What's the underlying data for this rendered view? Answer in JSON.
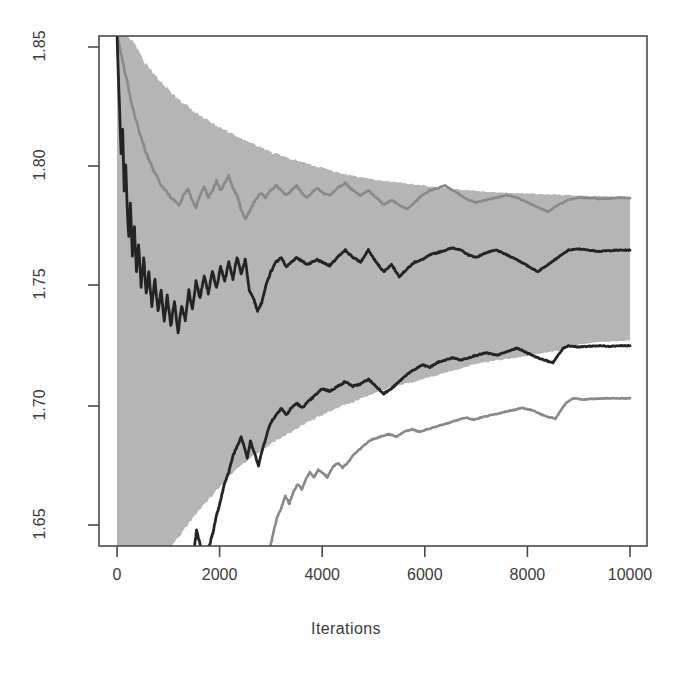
{
  "chart_data": {
    "type": "line",
    "title": "",
    "subtitle": "",
    "xlabel": "Iterations",
    "ylabel": "",
    "xlim": [
      0,
      10000
    ],
    "ylim": [
      1.6357,
      1.8553
    ],
    "xticks": [
      0,
      2000,
      4000,
      6000,
      8000,
      10000
    ],
    "xtick_labels": [
      "0",
      "2000",
      "4000",
      "6000",
      "8000",
      "10000"
    ],
    "yticks": [
      1.65,
      1.7,
      1.75,
      1.8,
      1.85
    ],
    "ytick_labels": [
      "1.65",
      "1.70",
      "1.75",
      "1.80",
      "1.85"
    ],
    "grid": false,
    "legend": "none",
    "colors": {
      "band_fill": "#b5b5b5",
      "dark_trace": "#242424",
      "gray_trace": "#898989",
      "frame": "#4a4a4a",
      "text": "#3b3b3b",
      "background": "#ffffff"
    },
    "series": [
      {
        "name": "band_upper",
        "role": "credible-band-upper-bound",
        "color": "#b5b5b5",
        "x": [
          0,
          60,
          120,
          180,
          240,
          300,
          360,
          420,
          480,
          540,
          600,
          700,
          800,
          900,
          1000,
          1100,
          1200,
          1300,
          1400,
          1500,
          1600,
          1700,
          1800,
          1900,
          2000,
          2200,
          2400,
          2600,
          2800,
          3000,
          3200,
          3400,
          3600,
          3800,
          4000,
          4300,
          4600,
          5000,
          5400,
          5800,
          6200,
          6600,
          7000,
          7400,
          7800,
          8200,
          8600,
          9000,
          9400,
          10000
        ],
        "y": [
          1.8553,
          1.8553,
          1.8553,
          1.8553,
          1.854,
          1.852,
          1.8505,
          1.848,
          1.8455,
          1.843,
          1.842,
          1.839,
          1.8365,
          1.834,
          1.8325,
          1.83,
          1.828,
          1.8265,
          1.825,
          1.823,
          1.8215,
          1.82,
          1.819,
          1.8175,
          1.8165,
          1.814,
          1.812,
          1.81,
          1.808,
          1.806,
          1.8045,
          1.803,
          1.802,
          1.8005,
          1.7995,
          1.7975,
          1.796,
          1.7945,
          1.7935,
          1.7925,
          1.7915,
          1.7905,
          1.7898,
          1.7892,
          1.7888,
          1.7885,
          1.7882,
          1.7878,
          1.7876,
          1.7872
        ]
      },
      {
        "name": "band_lower",
        "role": "credible-band-lower-bound",
        "color": "#b5b5b5",
        "x": [
          0,
          200,
          400,
          600,
          800,
          900,
          1000,
          1100,
          1200,
          1300,
          1400,
          1500,
          1600,
          1700,
          1800,
          1900,
          2000,
          2200,
          2400,
          2600,
          2800,
          3000,
          3200,
          3400,
          3600,
          3800,
          4000,
          4300,
          4600,
          5000,
          5400,
          5800,
          6200,
          6600,
          7000,
          7400,
          7800,
          8200,
          8600,
          9000,
          9400,
          10000
        ],
        "y": [
          1.6357,
          1.6357,
          1.6357,
          1.6357,
          1.6357,
          1.637,
          1.639,
          1.642,
          1.645,
          1.6475,
          1.6505,
          1.6535,
          1.656,
          1.6585,
          1.661,
          1.6635,
          1.666,
          1.6705,
          1.6745,
          1.678,
          1.681,
          1.684,
          1.6865,
          1.689,
          1.6915,
          1.694,
          1.696,
          1.699,
          1.7015,
          1.705,
          1.708,
          1.71,
          1.7125,
          1.715,
          1.7175,
          1.719,
          1.72,
          1.7215,
          1.723,
          1.7255,
          1.7265,
          1.7272
        ]
      },
      {
        "name": "upper_dark_trace",
        "role": "upper-quantile-dark",
        "color": "#242424",
        "x": [
          0,
          40,
          80,
          110,
          140,
          170,
          200,
          230,
          260,
          300,
          340,
          380,
          420,
          470,
          520,
          570,
          620,
          680,
          740,
          800,
          860,
          920,
          980,
          1050,
          1120,
          1190,
          1260,
          1330,
          1400,
          1470,
          1540,
          1620,
          1700,
          1780,
          1860,
          1940,
          2020,
          2100,
          2180,
          2260,
          2340,
          2420,
          2500,
          2580,
          2660,
          2740,
          2820,
          2900,
          3000,
          3100,
          3200,
          3300,
          3400,
          3500,
          3600,
          3700,
          3800,
          3900,
          4000,
          4150,
          4300,
          4450,
          4600,
          4750,
          4900,
          5050,
          5200,
          5350,
          5500,
          5650,
          5800,
          5950,
          6100,
          6250,
          6400,
          6550,
          6700,
          6850,
          7000,
          7200,
          7400,
          7600,
          7800,
          8000,
          8200,
          8400,
          8600,
          8800,
          9000,
          9200,
          9400,
          9600,
          9800,
          10000
        ],
        "y": [
          1.8553,
          1.83,
          1.805,
          1.815,
          1.79,
          1.8,
          1.782,
          1.77,
          1.785,
          1.762,
          1.774,
          1.756,
          1.768,
          1.75,
          1.762,
          1.747,
          1.756,
          1.742,
          1.753,
          1.739,
          1.748,
          1.735,
          1.746,
          1.733,
          1.744,
          1.73,
          1.742,
          1.736,
          1.748,
          1.74,
          1.752,
          1.745,
          1.754,
          1.747,
          1.756,
          1.749,
          1.758,
          1.752,
          1.76,
          1.753,
          1.762,
          1.755,
          1.761,
          1.748,
          1.745,
          1.7395,
          1.743,
          1.75,
          1.756,
          1.76,
          1.762,
          1.758,
          1.76,
          1.762,
          1.7605,
          1.759,
          1.76,
          1.761,
          1.76,
          1.7585,
          1.762,
          1.765,
          1.762,
          1.76,
          1.765,
          1.76,
          1.756,
          1.759,
          1.754,
          1.757,
          1.76,
          1.761,
          1.763,
          1.764,
          1.765,
          1.766,
          1.765,
          1.763,
          1.762,
          1.764,
          1.765,
          1.763,
          1.761,
          1.7585,
          1.756,
          1.759,
          1.762,
          1.765,
          1.7655,
          1.765,
          1.7645,
          1.7648,
          1.765,
          1.765
        ]
      },
      {
        "name": "upper_gray_trace",
        "role": "upper-quantile-grey",
        "color": "#898989",
        "x": [
          0,
          40,
          80,
          120,
          160,
          200,
          250,
          300,
          350,
          400,
          450,
          500,
          560,
          620,
          680,
          740,
          800,
          870,
          940,
          1010,
          1080,
          1150,
          1220,
          1300,
          1380,
          1460,
          1540,
          1620,
          1700,
          1780,
          1860,
          1940,
          2020,
          2100,
          2180,
          2260,
          2340,
          2420,
          2500,
          2600,
          2700,
          2800,
          2900,
          3000,
          3100,
          3200,
          3300,
          3400,
          3500,
          3600,
          3700,
          3800,
          3900,
          4000,
          4150,
          4300,
          4450,
          4600,
          4750,
          4900,
          5050,
          5200,
          5350,
          5500,
          5650,
          5800,
          5950,
          6100,
          6250,
          6400,
          6550,
          6700,
          6850,
          7000,
          7200,
          7400,
          7600,
          7800,
          8000,
          8200,
          8400,
          8600,
          8800,
          9000,
          9200,
          9400,
          9600,
          9800,
          10000
        ],
        "y": [
          1.8553,
          1.852,
          1.847,
          1.843,
          1.839,
          1.835,
          1.83,
          1.825,
          1.821,
          1.817,
          1.813,
          1.81,
          1.806,
          1.803,
          1.8,
          1.797,
          1.795,
          1.792,
          1.79,
          1.788,
          1.7865,
          1.785,
          1.784,
          1.788,
          1.791,
          1.786,
          1.783,
          1.788,
          1.792,
          1.787,
          1.79,
          1.794,
          1.79,
          1.793,
          1.796,
          1.791,
          1.788,
          1.782,
          1.778,
          1.782,
          1.786,
          1.789,
          1.787,
          1.79,
          1.792,
          1.79,
          1.788,
          1.79,
          1.792,
          1.789,
          1.787,
          1.789,
          1.791,
          1.789,
          1.788,
          1.791,
          1.793,
          1.79,
          1.788,
          1.79,
          1.787,
          1.784,
          1.786,
          1.784,
          1.782,
          1.785,
          1.788,
          1.79,
          1.791,
          1.792,
          1.79,
          1.788,
          1.786,
          1.785,
          1.786,
          1.787,
          1.788,
          1.787,
          1.785,
          1.783,
          1.781,
          1.784,
          1.786,
          1.787,
          1.7868,
          1.7865,
          1.7866,
          1.787,
          1.7868
        ]
      },
      {
        "name": "lower_dark_trace",
        "role": "lower-quantile-dark",
        "color": "#242424",
        "x": [
          1250,
          1300,
          1350,
          1420,
          1480,
          1550,
          1620,
          1700,
          1780,
          1860,
          1940,
          2020,
          2100,
          2180,
          2260,
          2340,
          2420,
          2480,
          2540,
          2600,
          2680,
          2760,
          2840,
          2920,
          3000,
          3100,
          3200,
          3300,
          3400,
          3500,
          3600,
          3700,
          3800,
          3900,
          4000,
          4150,
          4300,
          4450,
          4600,
          4750,
          4900,
          5050,
          5200,
          5350,
          5500,
          5650,
          5800,
          5950,
          6100,
          6250,
          6400,
          6550,
          6700,
          6850,
          7000,
          7200,
          7400,
          7600,
          7800,
          8000,
          8200,
          8400,
          8500,
          8600,
          8700,
          8800,
          9000,
          9200,
          9400,
          9600,
          9800,
          10000
        ],
        "y": [
          1.6357,
          1.64,
          1.636,
          1.6357,
          1.6357,
          1.648,
          1.642,
          1.6357,
          1.64,
          1.646,
          1.654,
          1.66,
          1.668,
          1.672,
          1.679,
          1.683,
          1.687,
          1.683,
          1.678,
          1.685,
          1.68,
          1.675,
          1.682,
          1.688,
          1.693,
          1.696,
          1.699,
          1.696,
          1.699,
          1.701,
          1.699,
          1.701,
          1.703,
          1.705,
          1.707,
          1.706,
          1.708,
          1.71,
          1.708,
          1.709,
          1.711,
          1.708,
          1.705,
          1.707,
          1.71,
          1.713,
          1.715,
          1.717,
          1.716,
          1.718,
          1.719,
          1.72,
          1.719,
          1.72,
          1.721,
          1.722,
          1.721,
          1.7225,
          1.724,
          1.722,
          1.72,
          1.7185,
          1.718,
          1.721,
          1.724,
          1.725,
          1.7245,
          1.7248,
          1.725,
          1.7248,
          1.725,
          1.725
        ]
      },
      {
        "name": "lower_gray_trace",
        "role": "lower-quantile-grey",
        "color": "#898989",
        "x": [
          2950,
          3000,
          3060,
          3120,
          3200,
          3280,
          3360,
          3440,
          3520,
          3600,
          3680,
          3760,
          3840,
          3920,
          4000,
          4100,
          4200,
          4300,
          4400,
          4500,
          4600,
          4700,
          4800,
          4900,
          5000,
          5150,
          5300,
          5450,
          5600,
          5750,
          5900,
          6050,
          6200,
          6350,
          6500,
          6650,
          6800,
          6950,
          7100,
          7300,
          7500,
          7700,
          7900,
          8100,
          8300,
          8450,
          8550,
          8650,
          8750,
          8900,
          9100,
          9300,
          9500,
          9700,
          10000
        ],
        "y": [
          1.6357,
          1.642,
          1.648,
          1.653,
          1.657,
          1.662,
          1.659,
          1.664,
          1.667,
          1.665,
          1.669,
          1.672,
          1.67,
          1.673,
          1.672,
          1.67,
          1.674,
          1.676,
          1.674,
          1.676,
          1.679,
          1.681,
          1.683,
          1.685,
          1.686,
          1.687,
          1.688,
          1.687,
          1.689,
          1.69,
          1.689,
          1.69,
          1.691,
          1.692,
          1.693,
          1.694,
          1.695,
          1.694,
          1.695,
          1.696,
          1.697,
          1.698,
          1.699,
          1.698,
          1.696,
          1.695,
          1.6945,
          1.698,
          1.701,
          1.703,
          1.7025,
          1.7028,
          1.703,
          1.703,
          1.703
        ]
      }
    ]
  },
  "axis": {
    "xlabel": "Iterations",
    "xtick_labels": [
      "0",
      "2000",
      "4000",
      "6000",
      "8000",
      "10000"
    ],
    "ytick_labels": [
      "1.65",
      "1.70",
      "1.75",
      "1.80",
      "1.85"
    ]
  }
}
